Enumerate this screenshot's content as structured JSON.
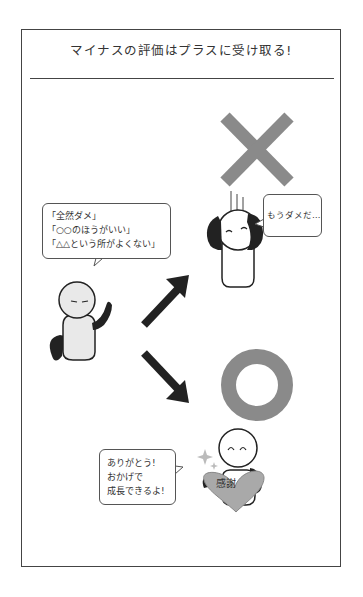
{
  "header": {
    "title": "マイナスの評価はプラスに受け取る!"
  },
  "criticism_bubble": {
    "lines": [
      "「全然ダメ」",
      "「○○のほうがいい」",
      "「△△という所がよくない」"
    ]
  },
  "negative_bubble": {
    "text": "もうダメだ…"
  },
  "positive_bubble": {
    "lines": [
      "ありがとう!",
      "おかげで",
      "成長できるよ!"
    ]
  },
  "heart": {
    "label": "感謝"
  },
  "symbols": {
    "negative_mark": "cross-mark",
    "positive_mark": "circle-mark"
  },
  "colors": {
    "mark_gray": "#8a8a8a",
    "heart_gray": "#a9a9a9",
    "limb_black": "#222222",
    "body_light": "#e9e9e9",
    "frame": "#444444"
  }
}
